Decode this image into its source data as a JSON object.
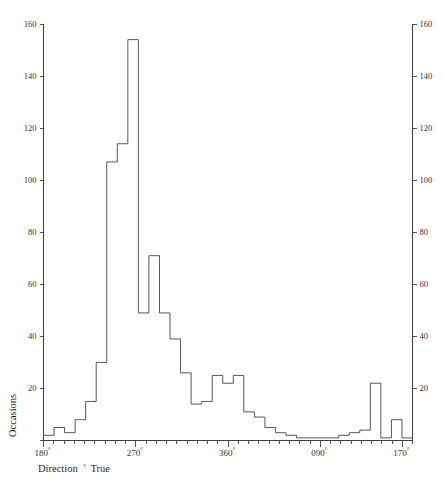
{
  "chart_data": {
    "type": "bar",
    "title": "",
    "subtitle": "",
    "xlabel": "Direction ° True",
    "ylabel": "Occasions",
    "xlabel_parts": {
      "text": "Direction",
      "degree": "°",
      "suffix": "True"
    },
    "ylim": [
      0,
      160
    ],
    "y_ticks": [
      0,
      20,
      40,
      60,
      80,
      100,
      120,
      140,
      160
    ],
    "y_tick_labels": [
      "0",
      "20",
      "40",
      "60",
      "80",
      "100",
      "120",
      "140",
      "160"
    ],
    "y_axis_right": true,
    "y_ticks_right": [
      20,
      40,
      60,
      80,
      100,
      120,
      140,
      160
    ],
    "y_tick_labels_right": [
      "20",
      "40",
      "60",
      "80",
      "100",
      "120",
      "140",
      "160"
    ],
    "grid": false,
    "legend": null,
    "x_tick_labels": [
      "180°",
      "270°",
      "360°",
      "090°",
      "170°"
    ],
    "x_tick_values": [
      180,
      270,
      360,
      450,
      530
    ],
    "x_minor_tick_step": 10,
    "xlim": [
      180,
      540
    ],
    "bin_width": 10,
    "bin_unit": "degrees",
    "categories": [
      "180",
      "190",
      "200",
      "210",
      "220",
      "230",
      "240",
      "250",
      "260",
      "270",
      "280",
      "290",
      "300",
      "310",
      "320",
      "330",
      "340",
      "350",
      "360",
      "010",
      "020",
      "030",
      "040",
      "050",
      "060",
      "070",
      "080",
      "090",
      "100",
      "110",
      "120",
      "130",
      "140",
      "150",
      "160"
    ],
    "values": [
      2,
      5,
      3,
      8,
      15,
      30,
      107,
      114,
      154,
      49,
      71,
      49,
      39,
      26,
      14,
      15,
      25,
      22,
      25,
      11,
      9,
      5,
      3,
      2,
      1,
      1,
      1,
      1,
      2,
      3,
      4,
      22,
      1,
      8,
      1
    ],
    "peak_value": 154,
    "peak_category": "260"
  },
  "figure": {
    "background": "#ffffff",
    "line_color": "#3a3a3a",
    "axis_color": "#2b2b2b",
    "text_color": "#333333"
  }
}
